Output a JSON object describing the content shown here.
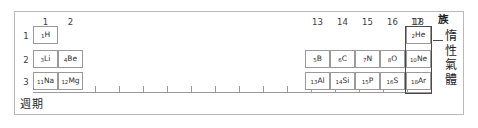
{
  "figure": {
    "kind": "periodic-table-main-groups",
    "axis_label_group": "族",
    "axis_label_period": "週期",
    "callout_label": "惰性氣體",
    "colors": {
      "frame": "#b9b9b9",
      "cell_border": "#9a9a9a",
      "highlight_border": "#4a4a4a",
      "text": "#2e2e2e",
      "background": "#ffffff"
    }
  },
  "groups": {
    "left": [
      {
        "number": "1",
        "x": 33
      },
      {
        "number": "2",
        "x": 58
      }
    ],
    "right": [
      {
        "number": "13",
        "x": 307
      },
      {
        "number": "14",
        "x": 332
      },
      {
        "number": "15",
        "x": 357
      },
      {
        "number": "16",
        "x": 382
      },
      {
        "number": "17",
        "x": 407
      },
      {
        "number": "18",
        "x": 407
      }
    ],
    "right_numbers": [
      "13",
      "14",
      "15",
      "16",
      "17",
      "18"
    ]
  },
  "periods": [
    {
      "number": "1",
      "y": 31
    },
    {
      "number": "2",
      "y": 55
    },
    {
      "number": "3",
      "y": 76
    }
  ],
  "cells": [
    {
      "z": "1",
      "symbol": "H",
      "group": 1,
      "period": 1,
      "x": 33,
      "y": 26
    },
    {
      "z": "3",
      "symbol": "Li",
      "group": 1,
      "period": 2,
      "x": 33,
      "y": 50
    },
    {
      "z": "4",
      "symbol": "Be",
      "group": 2,
      "period": 2,
      "x": 58,
      "y": 50
    },
    {
      "z": "11",
      "symbol": "Na",
      "group": 1,
      "period": 3,
      "x": 33,
      "y": 72
    },
    {
      "z": "12",
      "symbol": "Mg",
      "group": 2,
      "period": 3,
      "x": 58,
      "y": 72
    },
    {
      "z": "5",
      "symbol": "B",
      "group": 13,
      "period": 2,
      "x": 305,
      "y": 50
    },
    {
      "z": "6",
      "symbol": "C",
      "group": 14,
      "period": 2,
      "x": 330,
      "y": 50
    },
    {
      "z": "7",
      "symbol": "N",
      "group": 15,
      "period": 2,
      "x": 355,
      "y": 50
    },
    {
      "z": "8",
      "symbol": "O",
      "group": 16,
      "period": 2,
      "x": 380,
      "y": 50
    },
    {
      "z": "9",
      "symbol": "F",
      "group": 17,
      "period": 2,
      "x": 405,
      "y": 50
    },
    {
      "z": "10",
      "symbol": "Ne",
      "group": 18,
      "period": 2,
      "x": 406,
      "y": 50
    },
    {
      "z": "13",
      "symbol": "Al",
      "group": 13,
      "period": 3,
      "x": 305,
      "y": 72
    },
    {
      "z": "14",
      "symbol": "Si",
      "group": 14,
      "period": 3,
      "x": 330,
      "y": 72
    },
    {
      "z": "15",
      "symbol": "P",
      "group": 15,
      "period": 3,
      "x": 355,
      "y": 72
    },
    {
      "z": "16",
      "symbol": "S",
      "group": 16,
      "period": 3,
      "x": 380,
      "y": 72
    },
    {
      "z": "17",
      "symbol": "Cl",
      "group": 17,
      "period": 3,
      "x": 405,
      "y": 72
    },
    {
      "z": "18",
      "symbol": "Ar",
      "group": 18,
      "period": 3,
      "x": 406,
      "y": 72
    },
    {
      "z": "2",
      "symbol": "He",
      "group": 18,
      "period": 1,
      "x": 406,
      "y": 26
    }
  ],
  "noble_gas_column": {
    "elements": [
      "He",
      "Ne",
      "Ar"
    ],
    "label": "惰性氣體",
    "label_chars": [
      "惰",
      "性",
      "氣",
      "體"
    ]
  },
  "ticks": {
    "count": 14,
    "start_x": 95,
    "spacing": 24
  }
}
